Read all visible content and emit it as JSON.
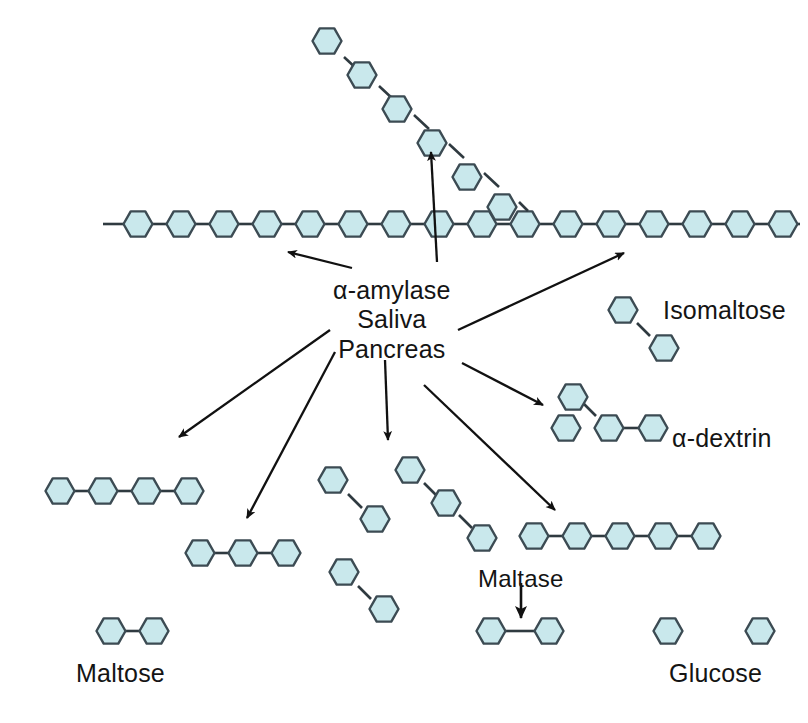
{
  "figure": {
    "background_color": "#ffffff",
    "hexagon_fill": "#c9e8ec",
    "hexagon_stroke": "#3c4b53",
    "bond_color": "#2f3a40",
    "arrow_color": "#111111",
    "text_color": "#141414"
  },
  "labels": {
    "enzyme_line1": "α-amylase",
    "enzyme_line2": "Saliva",
    "enzyme_line3": "Pancreas",
    "isomaltose": "Isomaltose",
    "alpha_dextrin": "α-dextrin",
    "maltase": "Maltase",
    "maltose": "Maltose",
    "glucose": "Glucose"
  },
  "structures": [
    {
      "name": "starch-main-chain",
      "description": "long horizontal alpha-1,4 linked glucose chain (starch backbone) with open bonds at both ends and a branch point",
      "units": 16,
      "orientation": "horizontal",
      "y": 224,
      "x_start": 103,
      "x_end": 800
    },
    {
      "name": "starch-branch-chain",
      "description": "diagonal alpha-1,6 branch of glucose units descending to the main chain",
      "units": 7,
      "orientation": "diagonal-down-right",
      "x_start": 325,
      "y_start": 42,
      "x_end": 533,
      "y_end": 216
    },
    {
      "name": "product-tetrasaccharide",
      "description": "four linked glucose units",
      "units": 4,
      "orientation": "horizontal",
      "x": 45,
      "y": 491
    },
    {
      "name": "product-trisaccharide",
      "description": "three linked glucose units",
      "units": 3,
      "orientation": "horizontal",
      "x": 185,
      "y": 553
    },
    {
      "name": "product-isomaltose-center-upper",
      "description": "two glucose units joined by a diagonal alpha-1,6 bond",
      "units": 2,
      "orientation": "diagonal",
      "x": 325,
      "y": 482
    },
    {
      "name": "product-branched-trisaccharide",
      "description": "three glucose units in a diagonal staircase arrangement",
      "units": 3,
      "orientation": "diagonal",
      "x": 400,
      "y": 468
    },
    {
      "name": "product-isomaltose-center-lower",
      "description": "two glucose units joined by a diagonal alpha-1,6 bond",
      "units": 2,
      "orientation": "diagonal",
      "x": 337,
      "y": 572
    },
    {
      "name": "product-pentasaccharide",
      "description": "five linked glucose units",
      "units": 5,
      "orientation": "horizontal",
      "x": 518,
      "y": 536
    },
    {
      "name": "isomaltose",
      "description": "two glucose units with alpha-1,6 diagonal bond",
      "units": 2,
      "orientation": "diagonal",
      "x": 600,
      "y": 305
    },
    {
      "name": "alpha-dextrin",
      "description": "branched oligosaccharide: fused pair with one unit above and one linked to the right",
      "units": 4,
      "orientation": "branched",
      "x": 548,
      "y": 400
    },
    {
      "name": "maltose-product-cleaved",
      "description": "two glucose units being cleaved by maltase",
      "units": 2,
      "orientation": "horizontal",
      "x": 487,
      "y": 631
    },
    {
      "name": "glucose-monomer-left",
      "description": "single free glucose unit",
      "units": 1,
      "orientation": "single",
      "x": 660,
      "y": 631
    },
    {
      "name": "glucose-monomer-right",
      "description": "single free glucose unit",
      "units": 1,
      "orientation": "single",
      "x": 752,
      "y": 631
    },
    {
      "name": "maltose",
      "description": "two linked glucose units labelled maltose",
      "units": 2,
      "orientation": "horizontal",
      "x": 107,
      "y": 631
    }
  ],
  "arrows": [
    {
      "name": "arrow-to-main-chain-left",
      "from": [
        352,
        268
      ],
      "to": [
        283,
        250
      ],
      "style": "long"
    },
    {
      "name": "arrow-to-branch-chain",
      "from": [
        435,
        262
      ],
      "to": [
        430,
        148
      ],
      "style": "long"
    },
    {
      "name": "arrow-to-main-chain-right",
      "from": [
        458,
        330
      ],
      "to": [
        627,
        252
      ],
      "style": "long"
    },
    {
      "name": "arrow-to-tetrasaccharide",
      "from": [
        330,
        330
      ],
      "to": [
        175,
        440
      ],
      "style": "long"
    },
    {
      "name": "arrow-to-trisaccharide",
      "from": [
        335,
        352
      ],
      "to": [
        245,
        521
      ],
      "style": "long"
    },
    {
      "name": "arrow-to-isomaltose-lower",
      "from": [
        385,
        360
      ],
      "to": [
        388,
        443
      ],
      "style": "long"
    },
    {
      "name": "arrow-to-alpha-dextrin",
      "from": [
        462,
        363
      ],
      "to": [
        545,
        407
      ],
      "style": "long"
    },
    {
      "name": "arrow-to-pentasaccharide",
      "from": [
        424,
        385
      ],
      "to": [
        558,
        513
      ],
      "style": "long"
    },
    {
      "name": "arrow-maltase-cleavage",
      "from": [
        520,
        583
      ],
      "to": [
        520,
        622
      ],
      "style": "short-thick"
    }
  ]
}
